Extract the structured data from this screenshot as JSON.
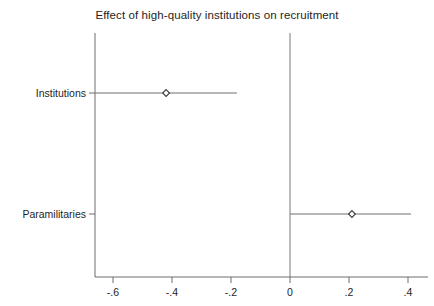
{
  "chart_data": {
    "type": "scatter",
    "title": "Effect of high-quality institutions on recruitment",
    "subtitle": "",
    "xlabel": "",
    "ylabel": "",
    "orientation": "horizontal",
    "xlim": [
      -0.66,
      0.44
    ],
    "grid": false,
    "legend": null,
    "reference_line": {
      "x": 0,
      "label": "0"
    },
    "marker_style": "hollow-diamond",
    "xticks": [
      -0.6,
      -0.4,
      -0.2,
      0,
      0.2,
      0.4
    ],
    "xtick_labels": [
      "-.6",
      "-.4",
      "-.2",
      "0",
      ".2",
      ".4"
    ],
    "categories": [
      "Institutions",
      "Paramilitaries"
    ],
    "points": [
      {
        "category": "Institutions",
        "estimate": -0.42,
        "ci_low": -0.66,
        "ci_high": -0.18
      },
      {
        "category": "Paramilitaries",
        "estimate": 0.21,
        "ci_low": 0.0,
        "ci_high": 0.41
      }
    ]
  },
  "style": {
    "axis_color": "#6d6d6d",
    "line_color": "#6e6e6e",
    "marker_color": "#3a3a3a",
    "text_color": "#1e1e1e",
    "background": "#ffffff"
  }
}
